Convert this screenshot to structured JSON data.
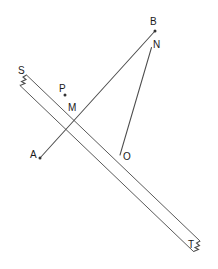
{
  "figure": {
    "background_color": "#ffffff",
    "line_color": "#4d4d4d",
    "label_color": "#1a1a1a",
    "width": 218,
    "height": 269
  },
  "labels": {
    "S": "S",
    "T": "T",
    "A": "A",
    "B": "B",
    "N": "N",
    "M": "M",
    "O": "O",
    "P": "P"
  },
  "label_positions": {
    "S": {
      "x": 18,
      "y": 66
    },
    "T": {
      "x": 188,
      "y": 240
    },
    "A": {
      "x": 30,
      "y": 150
    },
    "B": {
      "x": 150,
      "y": 17
    },
    "N": {
      "x": 153,
      "y": 40
    },
    "M": {
      "x": 68,
      "y": 103
    },
    "O": {
      "x": 123,
      "y": 152
    },
    "P": {
      "x": 59,
      "y": 84
    }
  },
  "points": {
    "S_top": {
      "x": 26.5,
      "y": 75.0
    },
    "S_bottom": {
      "x": 20.0,
      "y": 85.5
    },
    "T_top": {
      "x": 200.0,
      "y": 241.0
    },
    "T_bottom": {
      "x": 193.5,
      "y": 251.5
    },
    "A": {
      "x": 40.0,
      "y": 158.0
    },
    "B": {
      "x": 155.0,
      "y": 31.0
    },
    "N": {
      "x": 151.5,
      "y": 47.5
    },
    "M": {
      "x": 75.5,
      "y": 117.0
    },
    "O": {
      "x": 120.0,
      "y": 155.0
    },
    "P": {
      "x": 65.0,
      "y": 95.0
    }
  },
  "marked_dots": [
    {
      "name": "point-A-dot",
      "x": 40.0,
      "y": 158.0,
      "r": 1.5
    },
    {
      "name": "point-B-dot",
      "x": 155.0,
      "y": 31.0,
      "r": 1.5
    },
    {
      "name": "point-P-dot",
      "x": 65.0,
      "y": 95.0,
      "r": 1.5
    }
  ],
  "segments": [
    {
      "name": "ray-A-to-B",
      "from": "A",
      "to": "B"
    },
    {
      "name": "segment-N-to-O",
      "from": "N",
      "to": "O"
    },
    {
      "name": "band-upper-edge",
      "from": "S_top",
      "to": "T_top"
    },
    {
      "name": "band-lower-edge",
      "from": "S_bottom",
      "to": "T_bottom"
    }
  ],
  "break_marks": {
    "S_end": "zigzag",
    "T_end": "zigzag"
  }
}
